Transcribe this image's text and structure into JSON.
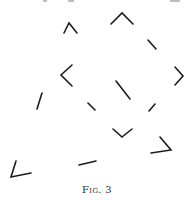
{
  "figure": {
    "caption": "Fig. 3",
    "stroke_color": "#1c1c1c",
    "background": "#ffffff",
    "marks": [
      {
        "name": "caret-up-small",
        "points": [
          [
            64,
            33
          ],
          [
            69,
            23
          ],
          [
            77,
            33
          ]
        ]
      },
      {
        "name": "caret-up-large",
        "points": [
          [
            111,
            24
          ],
          [
            122,
            13
          ],
          [
            133,
            24
          ]
        ]
      },
      {
        "name": "dash-diagonal-upper-right",
        "points": [
          [
            148,
            40
          ],
          [
            156,
            49
          ]
        ]
      },
      {
        "name": "angle-left",
        "points": [
          [
            72,
            65
          ],
          [
            61,
            75
          ],
          [
            72,
            86
          ]
        ]
      },
      {
        "name": "angle-right",
        "points": [
          [
            175,
            67
          ],
          [
            183,
            76
          ],
          [
            175,
            85
          ]
        ]
      },
      {
        "name": "dash-diagonal-center",
        "points": [
          [
            116,
            81
          ],
          [
            130,
            99
          ]
        ]
      },
      {
        "name": "dash-slash-left",
        "points": [
          [
            42,
            93
          ],
          [
            37,
            109
          ]
        ]
      },
      {
        "name": "dash-short-center-left",
        "points": [
          [
            88,
            103
          ],
          [
            95,
            110
          ]
        ]
      },
      {
        "name": "dash-short-center-right",
        "points": [
          [
            155,
            104
          ],
          [
            149,
            111
          ]
        ]
      },
      {
        "name": "angle-down",
        "points": [
          [
            113,
            129
          ],
          [
            122,
            137
          ],
          [
            132,
            129
          ]
        ]
      },
      {
        "name": "angle-lower-right",
        "points": [
          [
            160,
            137
          ],
          [
            171,
            150
          ],
          [
            151,
            153
          ]
        ]
      },
      {
        "name": "angle-lower-left",
        "points": [
          [
            16,
            161
          ],
          [
            11,
            177
          ],
          [
            31,
            173
          ]
        ]
      },
      {
        "name": "dash-lower-center",
        "points": [
          [
            79,
            165
          ],
          [
            96,
            161
          ]
        ]
      }
    ]
  }
}
